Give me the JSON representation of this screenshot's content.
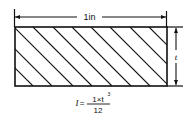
{
  "diagram": {
    "type": "cross-section",
    "width_dimension": {
      "label": "1in"
    },
    "height_dimension": {
      "label": "t"
    },
    "formula": {
      "lhs": "I",
      "equals": "=",
      "numerator": "1×t",
      "exponent": "3",
      "denominator": "12"
    },
    "colors": {
      "line": "#111111",
      "background": "#ffffff"
    }
  }
}
